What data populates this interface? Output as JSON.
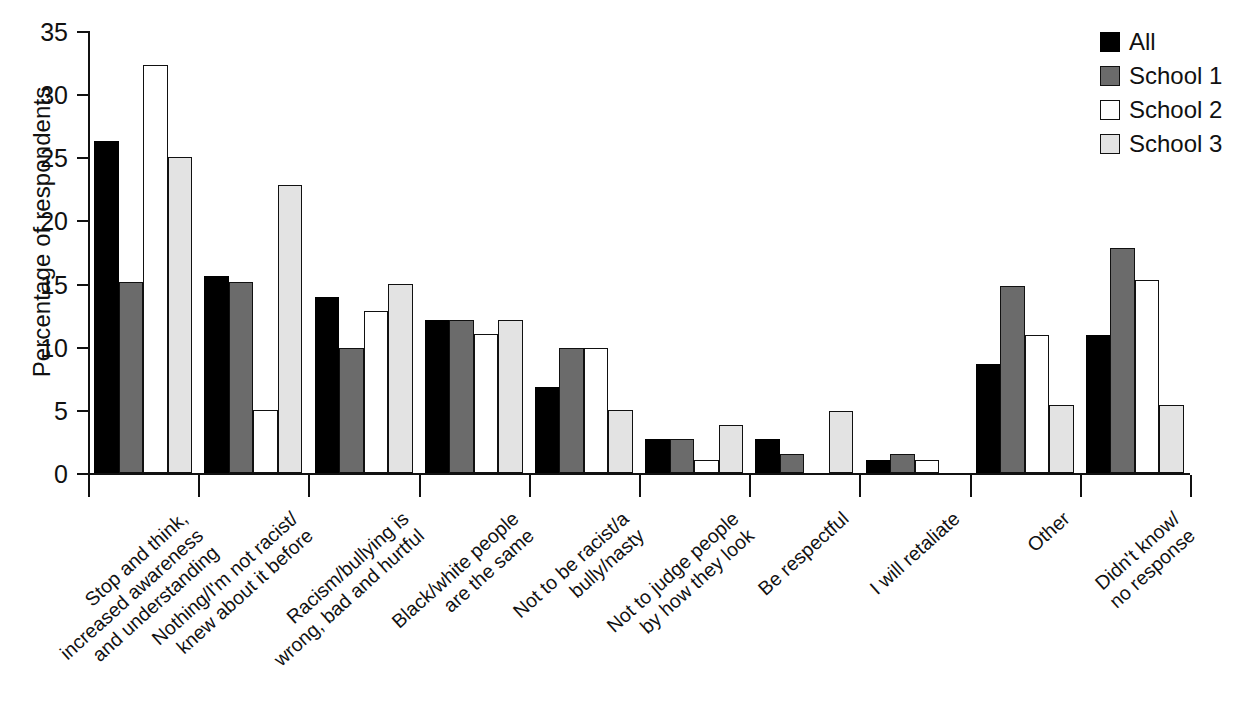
{
  "chart_data": {
    "type": "bar",
    "title": "",
    "xlabel": "",
    "ylabel": "Percentage of respondents",
    "ylim": [
      0,
      35
    ],
    "ytick_labels": [
      "0",
      "5",
      "10",
      "15",
      "20",
      "25",
      "30",
      "35"
    ],
    "ytick_values": [
      0,
      5,
      10,
      15,
      20,
      25,
      30,
      35
    ],
    "grid": false,
    "legend_position": "top-right",
    "categories": [
      "Stop and think,\nincreased awareness\nand understanding",
      "Nothing/I'm not racist/\nknew about it before",
      "Racism/bullying is\nwrong, bad and hurtful",
      "Black/white people\nare the same",
      "Not to be racist/a\nbully/nasty",
      "Not to judge people\nby how they look",
      "Be respectful",
      "I will retaliate",
      "Other",
      "Didn't know/\nno response"
    ],
    "series": [
      {
        "name": "All",
        "color": "#000000",
        "values": [
          26.3,
          15.6,
          13.9,
          12.1,
          6.8,
          2.7,
          2.7,
          1.0,
          8.6,
          10.9
        ]
      },
      {
        "name": "School 1",
        "color": "#6b6b6b",
        "values": [
          15.1,
          15.1,
          9.9,
          12.1,
          9.9,
          2.7,
          1.5,
          1.5,
          14.8,
          17.8
        ]
      },
      {
        "name": "School 2",
        "color": "#ffffff",
        "values": [
          32.3,
          5.0,
          12.8,
          11.0,
          9.9,
          1.0,
          0,
          1.0,
          10.9,
          15.3
        ]
      },
      {
        "name": "School 3",
        "color": "#e3e3e3",
        "values": [
          25.0,
          22.8,
          15.0,
          12.1,
          5.0,
          3.8,
          4.9,
          0,
          5.4,
          5.4
        ]
      }
    ]
  },
  "legend": {
    "items": [
      {
        "label": "All",
        "series_class": "series-all"
      },
      {
        "label": "School 1",
        "series_class": "series-school1"
      },
      {
        "label": "School 2",
        "series_class": "series-school2"
      },
      {
        "label": "School 3",
        "series_class": "series-school3"
      }
    ]
  },
  "axes": {
    "y_title": "Percentage of respondents"
  }
}
